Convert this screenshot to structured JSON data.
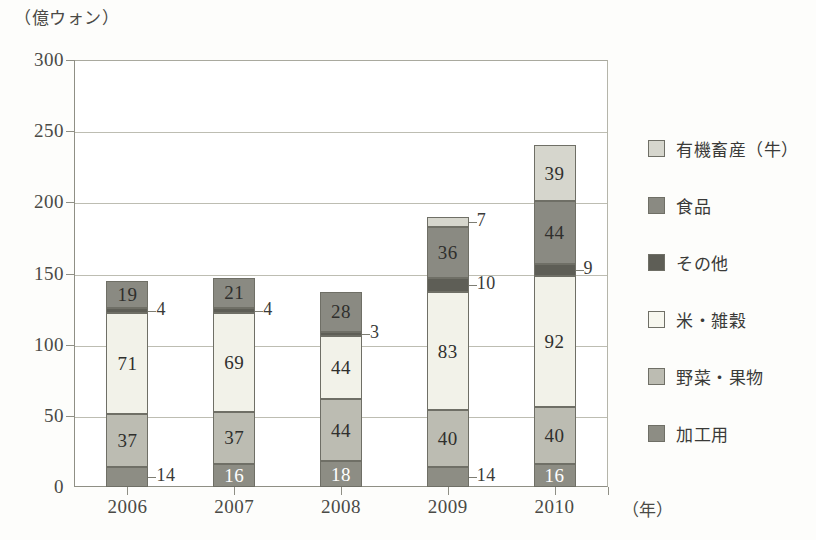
{
  "chart_data": {
    "type": "bar",
    "stacked": true,
    "title": "",
    "subtitle": "",
    "unit_caption": "（億ウォン）",
    "xlabel": "（年）",
    "ylabel": "",
    "categories": [
      "2006",
      "2007",
      "2008",
      "2009",
      "2010"
    ],
    "ylim": [
      0,
      300
    ],
    "yticks": [
      0,
      50,
      100,
      150,
      200,
      250,
      300
    ],
    "ytick_labels": [
      "0",
      "50",
      "100",
      "150",
      "200",
      "250",
      "300"
    ],
    "grid": true,
    "legend_position": "right",
    "series": [
      {
        "name": "加工用",
        "color": "#8d8d84",
        "label_color": "#ffffff",
        "values": [
          14,
          16,
          18,
          14,
          16
        ]
      },
      {
        "name": "野菜・果物",
        "color": "#bcbcb2",
        "label_color": "#2f2f2d",
        "values": [
          37,
          37,
          44,
          40,
          40
        ]
      },
      {
        "name": "米・雑穀",
        "color": "#f2f2e9",
        "label_color": "#2f2f2d",
        "values": [
          71,
          69,
          44,
          83,
          92
        ]
      },
      {
        "name": "その他",
        "color": "#5e5e56",
        "label_color": "#2f2f2d",
        "values": [
          4,
          4,
          3,
          10,
          9
        ],
        "label_outside": true
      },
      {
        "name": "食品",
        "color": "#8a8a82",
        "label_color": "#2f2f2d",
        "values": [
          19,
          21,
          28,
          36,
          44
        ]
      },
      {
        "name": "有機畜産（牛）",
        "color": "#d6d6cd",
        "label_color": "#2f2f2d",
        "values": [
          0,
          0,
          0,
          7,
          39
        ],
        "label_outside_small": true
      }
    ],
    "totals": [
      145,
      147,
      181,
      190,
      240
    ]
  },
  "legend": {
    "items": [
      {
        "label": "有機畜産（牛）",
        "color": "#d6d6cd"
      },
      {
        "label": "食品",
        "color": "#8a8a82"
      },
      {
        "label": "その他",
        "color": "#5e5e56"
      },
      {
        "label": "米・雑穀",
        "color": "#f7f7ef"
      },
      {
        "label": "野菜・果物",
        "color": "#bcbcb2"
      },
      {
        "label": "加工用",
        "color": "#8d8d84"
      }
    ]
  },
  "axes": {
    "y_unit": "（億ウォン）",
    "x_unit": "（年）"
  }
}
